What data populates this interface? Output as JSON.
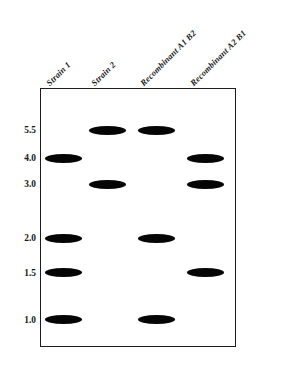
{
  "figure": {
    "background_color": "#ffffff",
    "band_color": "#050505",
    "box_border_color": "#1c1c1c"
  },
  "lanes": [
    {
      "label": "Strain 1",
      "center_pct": 11.5
    },
    {
      "label": "Strain 2",
      "center_pct": 34.5
    },
    {
      "label": "Recombinant A1 B2",
      "center_pct": 59.5
    },
    {
      "label": "Recombinant A2 B1",
      "center_pct": 85.0
    }
  ],
  "size_markers": [
    {
      "label": "5.5",
      "y_pct": 16.2
    },
    {
      "label": "4.0",
      "y_pct": 27.0
    },
    {
      "label": "3.0",
      "y_pct": 37.1
    },
    {
      "label": "2.0",
      "y_pct": 58.0
    },
    {
      "label": "1.5",
      "y_pct": 71.4
    },
    {
      "label": "1.0",
      "y_pct": 89.6
    }
  ],
  "chart_data": {
    "type": "table",
    "xlabel": "",
    "ylabel": "Fragment size (kb)",
    "categories": [
      "Strain 1",
      "Strain 2",
      "Recombinant A1 B2",
      "Recombinant A2 B1"
    ],
    "size_values": [
      5.5,
      4.0,
      3.0,
      2.0,
      1.5,
      1.0
    ],
    "bands": [
      {
        "size": "5.5",
        "lanes": [
          "Strain 2",
          "Recombinant A1 B2"
        ]
      },
      {
        "size": "4.0",
        "lanes": [
          "Strain 1",
          "Recombinant A2 B1"
        ]
      },
      {
        "size": "3.0",
        "lanes": [
          "Strain 2",
          "Recombinant A2 B1"
        ]
      },
      {
        "size": "2.0",
        "lanes": [
          "Strain 1",
          "Recombinant A1 B2"
        ]
      },
      {
        "size": "1.5",
        "lanes": [
          "Strain 1",
          "Recombinant A2 B1"
        ]
      },
      {
        "size": "1.0",
        "lanes": [
          "Strain 1",
          "Recombinant A1 B2"
        ]
      }
    ],
    "matrix": {
      "Strain 1": [
        "4.0",
        "2.0",
        "1.5",
        "1.0"
      ],
      "Strain 2": [
        "5.5",
        "3.0"
      ],
      "Recombinant A1 B2": [
        "5.5",
        "2.0",
        "1.0"
      ],
      "Recombinant A2 B1": [
        "4.0",
        "3.0",
        "1.5"
      ]
    }
  }
}
